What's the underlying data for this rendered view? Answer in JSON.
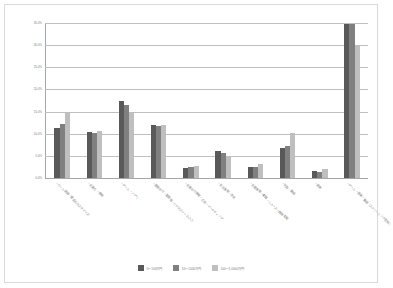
{
  "chart_data": {
    "type": "bar",
    "title": "",
    "xlabel": "",
    "ylabel": "",
    "ylim": [
      0,
      35
    ],
    "grid": true,
    "legend_position": "bottom",
    "yticks": [
      "0.0%",
      "5.0%",
      "10.0%",
      "15.0%",
      "20.0%",
      "25.0%",
      "30.0%",
      "35.0%"
    ],
    "ytick_values": [
      0,
      5,
      10,
      15,
      20,
      25,
      30,
      35
    ],
    "categories": [
      "・ホーム画面・壁紙のカスタマイズ",
      "・企業の・情報",
      "・ゲーム・アプリ",
      "・業務向け・業務用・ビジネスツール入力",
      "・企業向け情報・広告・マーケティング",
      "・生活情報・天気",
      "・企業情報・書籍・ニュース・雑誌閲覧",
      "・写真・動画",
      "・音楽",
      "・ゲーム・音楽・動画（ストリーミング配信）"
    ],
    "series": [
      {
        "name": "0〜100万円",
        "color": "#595959",
        "values": [
          11.3,
          10.4,
          17.4,
          11.9,
          2.3,
          6.2,
          2.4,
          6.7,
          1.6,
          34.8
        ]
      },
      {
        "name": "10〜1000万円",
        "color": "#808080",
        "values": [
          12.1,
          10.2,
          16.6,
          11.7,
          2.5,
          5.7,
          2.4,
          7.3,
          1.4,
          34.8
        ]
      },
      {
        "name": "100〜1,0000万円",
        "color": "#bfbfbf",
        "values": [
          14.7,
          10.6,
          14.7,
          12.0,
          2.7,
          4.9,
          3.1,
          10.2,
          2.0,
          29.8
        ]
      }
    ]
  }
}
